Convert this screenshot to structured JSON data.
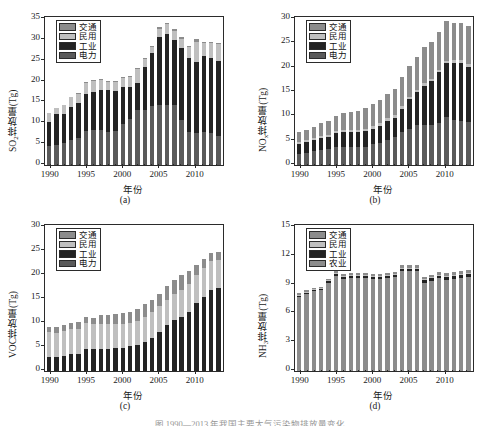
{
  "figure": {
    "caption": "图  1990—2013 年我国主要大气污染物排放量变化"
  },
  "common": {
    "xlabel": "年份",
    "xticks": [
      1990,
      1995,
      2000,
      2005,
      2010
    ],
    "years": [
      1990,
      1991,
      1992,
      1993,
      1994,
      1995,
      1996,
      1997,
      1998,
      1999,
      2000,
      2001,
      2002,
      2003,
      2004,
      2005,
      2006,
      2007,
      2008,
      2009,
      2010,
      2011,
      2012,
      2013
    ]
  },
  "colors": {
    "transport": "#8c8c8c",
    "residential": "#bfbfbf",
    "industry": "#232323",
    "power": "#5a5a5a",
    "agriculture": "#8c8c8c",
    "axis": "#2b2b2b",
    "background": "#ffffff"
  },
  "panels": [
    {
      "tag": "(a)",
      "ylabel_html": "SO<sub>2</sub>排放量(Tg)",
      "ylabel": "SO2排放量(Tg)",
      "legend": [
        "交通",
        "民用",
        "工业",
        "电力"
      ],
      "chart_data": {
        "type": "bar",
        "stacked": true,
        "title": "(a)",
        "xlabel": "年份",
        "ylabel": "SO2排放量(Tg)",
        "ylim": [
          0,
          35
        ],
        "yticks": [
          0,
          5,
          10,
          15,
          20,
          25,
          30,
          35
        ],
        "grid": false,
        "legend_position": "upper-left",
        "categories": [
          1990,
          1991,
          1992,
          1993,
          1994,
          1995,
          1996,
          1997,
          1998,
          1999,
          2000,
          2001,
          2002,
          2003,
          2004,
          2005,
          2006,
          2007,
          2008,
          2009,
          2010,
          2011,
          2012,
          2013
        ],
        "series": [
          {
            "name": "电力",
            "color": "#5a5a5a",
            "values": [
              4.6,
              4.8,
              5.3,
              6.1,
              6.5,
              8.1,
              8.5,
              8.5,
              8.0,
              8.1,
              9.8,
              11.0,
              13.2,
              13.3,
              14.2,
              14.3,
              14.4,
              14.5,
              10.9,
              8.0,
              7.7,
              8.0,
              7.7,
              6.9
            ]
          },
          {
            "name": "工业",
            "color": "#232323",
            "values": [
              5.7,
              7.5,
              7.0,
              7.9,
              8.4,
              8.9,
              9.1,
              9.6,
              9.9,
              9.7,
              8.8,
              7.6,
              6.5,
              10.2,
              12.6,
              16.4,
              16.9,
              15.5,
              17.2,
              17.6,
              17.0,
              18.1,
              17.9,
              18.0
            ]
          },
          {
            "name": "民用",
            "color": "#bfbfbf",
            "values": [
              2.1,
              1.3,
              2.1,
              2.2,
              2.1,
              2.6,
              2.6,
              2.4,
              2.1,
              2.1,
              2.3,
              2.5,
              3.3,
              1.9,
              1.4,
              2.0,
              2.4,
              2.2,
              2.1,
              2.6,
              4.9,
              3.2,
              3.7,
              4.0
            ]
          },
          {
            "name": "交通",
            "color": "#8c8c8c",
            "values": [
              0.1,
              0.1,
              0.1,
              0.1,
              0.2,
              0.2,
              0.2,
              0.2,
              0.2,
              0.2,
              0.2,
              0.3,
              0.3,
              0.3,
              0.3,
              0.4,
              0.4,
              0.4,
              0.4,
              0.4,
              0.5,
              0.3,
              0.3,
              0.4
            ]
          }
        ],
        "totals": [
          12.5,
          13.7,
          14.5,
          16.3,
          17.2,
          19.8,
          20.4,
          20.7,
          20.2,
          20.1,
          21.1,
          21.4,
          23.3,
          25.7,
          28.5,
          33.1,
          34.1,
          32.6,
          30.6,
          28.6,
          30.1,
          29.6,
          29.6,
          29.3
        ]
      }
    },
    {
      "tag": "(b)",
      "ylabel_html": "NO<sub>x</sub>排放量(Tg)",
      "ylabel": "NOx排放量(Tg)",
      "legend": [
        "交通",
        "民用",
        "工业",
        "电力"
      ],
      "chart_data": {
        "type": "bar",
        "stacked": true,
        "title": "(b)",
        "xlabel": "年份",
        "ylabel": "NOx排放量(Tg)",
        "ylim": [
          0,
          30
        ],
        "yticks": [
          0,
          5,
          10,
          15,
          20,
          25,
          30
        ],
        "grid": false,
        "legend_position": "upper-left",
        "categories": [
          1990,
          1991,
          1992,
          1993,
          1994,
          1995,
          1996,
          1997,
          1998,
          1999,
          2000,
          2001,
          2002,
          2003,
          2004,
          2005,
          2006,
          2007,
          2008,
          2009,
          2010,
          2011,
          2012,
          2013
        ],
        "series": [
          {
            "name": "电力",
            "color": "#5a5a5a",
            "values": [
              2.2,
              2.5,
              2.8,
              3.1,
              3.3,
              3.6,
              3.7,
              3.7,
              3.6,
              3.8,
              4.3,
              4.6,
              5.2,
              5.7,
              6.8,
              7.3,
              8.3,
              8.2,
              8.3,
              8.7,
              9.8,
              9.3,
              9.0,
              8.8
            ]
          },
          {
            "name": "工业",
            "color": "#232323",
            "values": [
              2.2,
              2.2,
              2.3,
              2.5,
              2.5,
              2.9,
              3.1,
              3.1,
              3.1,
              3.1,
              3.2,
              3.5,
              3.9,
              4.0,
              4.8,
              6.2,
              6.7,
              8.1,
              8.9,
              10.4,
              11.1,
              11.6,
              12.0,
              11.4
            ]
          },
          {
            "name": "民用",
            "color": "#bfbfbf",
            "values": [
              0.4,
              0.4,
              0.4,
              0.4,
              0.4,
              0.5,
              0.5,
              0.5,
              0.5,
              0.5,
              0.5,
              0.5,
              0.5,
              0.5,
              0.5,
              0.5,
              0.5,
              0.5,
              0.5,
              0.5,
              0.5,
              0.6,
              0.6,
              0.6
            ]
          },
          {
            "name": "交通",
            "color": "#8c8c8c",
            "values": [
              1.9,
              2.1,
              2.4,
              2.6,
              2.8,
              3.1,
              3.4,
              3.7,
              4.0,
              4.3,
              4.5,
              4.7,
              4.9,
              5.4,
              5.9,
              6.4,
              6.7,
              7.4,
              7.5,
              7.8,
              8.1,
              7.7,
              7.5,
              7.7
            ]
          }
        ],
        "totals": [
          6.7,
          7.2,
          7.9,
          8.6,
          9.0,
          10.1,
          10.7,
          11.0,
          11.2,
          11.7,
          12.5,
          13.3,
          14.5,
          15.6,
          18.0,
          20.4,
          22.2,
          24.2,
          25.2,
          27.4,
          29.5,
          29.2,
          29.1,
          28.5
        ]
      }
    },
    {
      "tag": "(c)",
      "ylabel_html": "VOC排放量(Tg)",
      "ylabel": "VOC排放量(Tg)",
      "legend": [
        "交通",
        "民用",
        "工业",
        "电力"
      ],
      "chart_data": {
        "type": "bar",
        "stacked": true,
        "title": "(c)",
        "xlabel": "年份",
        "ylabel": "VOC排放量(Tg)",
        "ylim": [
          0,
          30
        ],
        "yticks": [
          0,
          5,
          10,
          15,
          20,
          25,
          30
        ],
        "grid": false,
        "legend_position": "upper-left",
        "categories": [
          1990,
          1991,
          1992,
          1993,
          1994,
          1995,
          1996,
          1997,
          1998,
          1999,
          2000,
          2001,
          2002,
          2003,
          2004,
          2005,
          2006,
          2007,
          2008,
          2009,
          2010,
          2011,
          2012,
          2013
        ],
        "series": [
          {
            "name": "电力",
            "color": "#5a5a5a",
            "values": [
              0.1,
              0.1,
              0.1,
              0.1,
              0.1,
              0.1,
              0.1,
              0.1,
              0.1,
              0.1,
              0.1,
              0.1,
              0.1,
              0.1,
              0.1,
              0.1,
              0.1,
              0.1,
              0.1,
              0.1,
              0.1,
              0.1,
              0.1,
              0.1
            ]
          },
          {
            "name": "工业",
            "color": "#232323",
            "values": [
              2.8,
              2.9,
              3.1,
              3.4,
              3.5,
              4.4,
              4.4,
              4.5,
              4.5,
              4.6,
              4.8,
              5.1,
              5.3,
              6.0,
              6.8,
              8.0,
              9.5,
              10.5,
              11.2,
              12.3,
              14.1,
              15.4,
              16.7,
              17.2
            ]
          },
          {
            "name": "民用",
            "color": "#bfbfbf",
            "values": [
              5.2,
              5.0,
              5.1,
              5.2,
              5.2,
              5.6,
              5.3,
              5.3,
              5.2,
              5.1,
              4.9,
              4.8,
              5.0,
              5.2,
              5.3,
              5.4,
              5.3,
              5.4,
              5.5,
              5.7,
              5.9,
              6.0,
              6.1,
              5.8
            ]
          },
          {
            "name": "交通",
            "color": "#8c8c8c",
            "values": [
              1.0,
              1.1,
              1.3,
              1.4,
              1.5,
              1.2,
              1.3,
              1.7,
              1.9,
              2.0,
              2.3,
              2.4,
              2.5,
              2.6,
              2.6,
              2.5,
              2.8,
              3.0,
              3.3,
              2.8,
              2.0,
              1.8,
              1.6,
              1.8
            ]
          }
        ],
        "totals": [
          9.1,
          9.1,
          9.6,
          10.1,
          10.3,
          11.3,
          11.1,
          11.6,
          11.7,
          11.8,
          12.1,
          12.4,
          12.9,
          13.9,
          14.8,
          16.0,
          17.7,
          19.0,
          20.1,
          20.9,
          22.1,
          23.3,
          24.5,
          24.9
        ]
      }
    },
    {
      "tag": "(d)",
      "ylabel_html": "NH<sub>3</sub>排放量(Tg)",
      "ylabel": "NH3排放量(Tg)",
      "legend": [
        "交通",
        "民用",
        "工业",
        "农业"
      ],
      "chart_data": {
        "type": "bar",
        "stacked": true,
        "title": "(d)",
        "xlabel": "年份",
        "ylabel": "NH3排放量(Tg)",
        "ylim": [
          0,
          15
        ],
        "yticks": [
          0,
          3,
          6,
          9,
          12,
          15
        ],
        "grid": false,
        "legend_position": "upper-left",
        "categories": [
          1990,
          1991,
          1992,
          1993,
          1994,
          1995,
          1996,
          1997,
          1998,
          1999,
          2000,
          2001,
          2002,
          2003,
          2004,
          2005,
          2006,
          2007,
          2008,
          2009,
          2010,
          2011,
          2012,
          2013
        ],
        "series": [
          {
            "name": "农业",
            "color": "#8c8c8c",
            "values": [
              7.7,
              8.0,
              8.3,
              8.4,
              9.2,
              9.9,
              9.6,
              9.7,
              9.7,
              9.7,
              9.6,
              9.6,
              9.7,
              9.8,
              10.4,
              10.4,
              10.4,
              9.2,
              9.4,
              9.7,
              9.5,
              9.6,
              9.7,
              9.8
            ]
          },
          {
            "name": "工业",
            "color": "#232323",
            "values": [
              0.15,
              0.15,
              0.15,
              0.15,
              0.15,
              0.2,
              0.2,
              0.2,
              0.2,
              0.2,
              0.2,
              0.2,
              0.2,
              0.2,
              0.25,
              0.25,
              0.25,
              0.25,
              0.25,
              0.25,
              0.3,
              0.3,
              0.3,
              0.3
            ]
          },
          {
            "name": "民用",
            "color": "#bfbfbf",
            "values": [
              0.1,
              0.1,
              0.1,
              0.1,
              0.1,
              0.1,
              0.1,
              0.1,
              0.1,
              0.1,
              0.1,
              0.1,
              0.1,
              0.1,
              0.1,
              0.1,
              0.1,
              0.1,
              0.1,
              0.1,
              0.1,
              0.1,
              0.1,
              0.1
            ]
          },
          {
            "name": "交通",
            "color": "#8c8c8c",
            "values": [
              0.15,
              0.15,
              0.15,
              0.15,
              0.15,
              0.2,
              0.2,
              0.2,
              0.2,
              0.2,
              0.2,
              0.2,
              0.2,
              0.2,
              0.25,
              0.25,
              0.25,
              0.25,
              0.25,
              0.25,
              0.3,
              0.3,
              0.3,
              0.3
            ]
          }
        ],
        "totals": [
          8.1,
          8.4,
          8.7,
          8.8,
          9.6,
          10.4,
          10.1,
          10.2,
          10.2,
          10.2,
          10.1,
          10.1,
          10.2,
          10.3,
          10.9,
          11.0,
          11.0,
          9.8,
          10.0,
          10.3,
          10.2,
          10.3,
          10.4,
          10.5
        ]
      }
    }
  ]
}
